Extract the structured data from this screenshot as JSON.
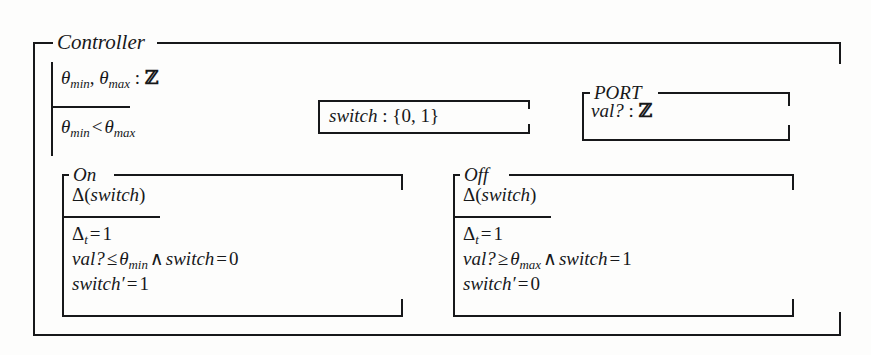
{
  "figure": {
    "kind": "z-notation-specification",
    "background_color": "#fdfdfc",
    "ink_color": "#17181a"
  },
  "controller": {
    "name": "Controller",
    "declarations": [
      {
        "text": "θmin, θmax : ℤ",
        "parts": {
          "var1": "θ",
          "sub1": "min",
          "var2": "θ",
          "sub2": "max",
          "type": "ℤ"
        }
      }
    ],
    "predicates": [
      {
        "text": "θmin < θmax"
      }
    ]
  },
  "switch_axdef": {
    "name": "",
    "declaration": "switch : {0, 1}",
    "identifier": "switch",
    "colon": ":",
    "set": "{0, 1}"
  },
  "port": {
    "name": "PORT",
    "declarations": [
      {
        "text": "val? : ℤ",
        "identifier": "val?",
        "type": "ℤ"
      }
    ]
  },
  "on": {
    "name": "On",
    "declarations": [
      {
        "text": "Δ(switch)"
      }
    ],
    "predicates": [
      {
        "text": "Δt = 1"
      },
      {
        "text": "val? ≤ θmin ∧ switch = 0"
      },
      {
        "text": "switch′ = 1"
      }
    ]
  },
  "off": {
    "name": "Off",
    "declarations": [
      {
        "text": "Δ(switch)"
      }
    ],
    "predicates": [
      {
        "text": "Δt = 1"
      },
      {
        "text": "val? ≥ θmax ∧ switch = 1"
      },
      {
        "text": "switch′ = 0"
      }
    ]
  },
  "glyphs": {
    "theta": "θ",
    "delta": "Δ",
    "integers": "ℤ",
    "and": "∧",
    "leq": "≤",
    "geq": "≥",
    "lt": "<",
    "eq": "=",
    "prime": "′",
    "question": "?"
  }
}
